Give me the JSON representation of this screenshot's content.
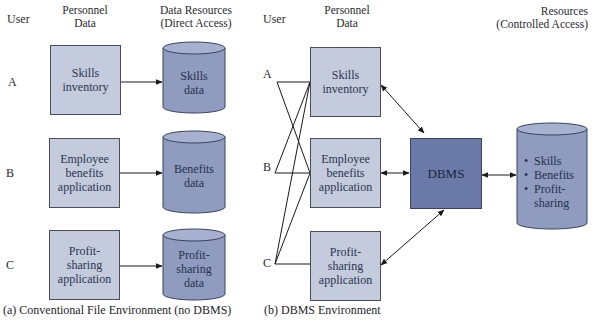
{
  "panel_a": {
    "headers": {
      "user": "User",
      "personnel": "Personnel\nData",
      "resources_line1": "Data Resources",
      "resources_line2": "(Direct Access)"
    },
    "users": [
      "A",
      "B",
      "C"
    ],
    "applications": [
      "Skills inventory",
      "Employee benefits application",
      "Profit-sharing application"
    ],
    "data_stores": [
      "Skills data",
      "Benefits data",
      "Profit-sharing data"
    ],
    "caption": "(a) Conventional File Environment (no DBMS)"
  },
  "panel_b": {
    "headers": {
      "user": "User",
      "personnel_line1": "Personnel",
      "personnel_line2": "Data",
      "resources_line1": "Resources",
      "resources_line2": "(Controlled Access)"
    },
    "users": [
      "A",
      "B",
      "C"
    ],
    "applications": [
      "Skills inventory",
      "Employee benefits application",
      "Profit-sharing application"
    ],
    "dbms_label": "DBMS",
    "database_items": [
      "Skills",
      "Benefits",
      "Profit-sharing"
    ],
    "caption": "(b) DBMS Environment"
  },
  "colors": {
    "app_box": "#c3cbdc",
    "data_cylinder": "#8f9cc0",
    "dbms_box": "#6a79a8",
    "line": "#1a1a1a"
  }
}
